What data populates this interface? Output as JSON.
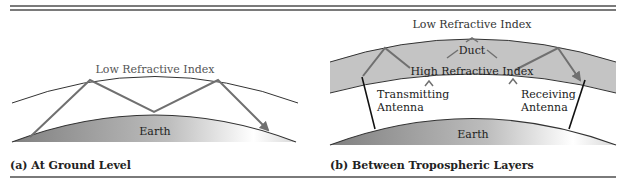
{
  "colors": {
    "rule": "#7a7a7a",
    "ray": "#707070",
    "arc": "#333333",
    "duct_fill": "#c4c4c4",
    "earth_dark": "#8a8a8a",
    "earth_light": "#ffffff",
    "text": "#222222",
    "label_gray": "#555555"
  },
  "panel_a": {
    "sky_label": "Low Refractive Index",
    "earth_label": "Earth",
    "caption": "(a) At Ground Level"
  },
  "panel_b": {
    "sky_label": "Low Refractive Index",
    "duct_label": "Duct",
    "high_label": "High Refractive Index",
    "tx_label_1": "Transmitting",
    "tx_label_2": "Antenna",
    "rx_label_1": "Receiving",
    "rx_label_2": "Antenna",
    "earth_label": "Earth",
    "caption": "(b) Between Tropospheric Layers"
  }
}
